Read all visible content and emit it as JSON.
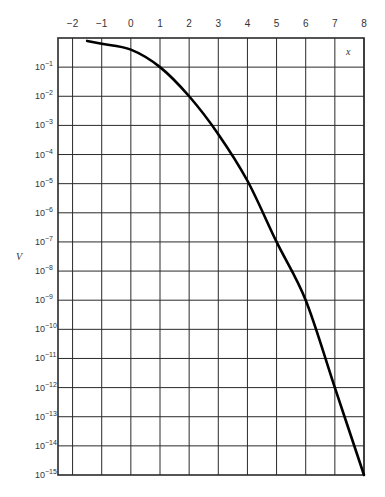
{
  "chart_data": {
    "type": "line",
    "title": "",
    "xlabel": "x",
    "ylabel": "V",
    "x_ticks": [
      "-2",
      "-1",
      "0",
      "1",
      "2",
      "3",
      "4",
      "5",
      "6",
      "7",
      "8"
    ],
    "y_ticks": [
      "10^-1",
      "10^-2",
      "10^-3",
      "10^-4",
      "10^-5",
      "10^-6",
      "10^-7",
      "10^-8",
      "10^-9",
      "10^-10",
      "10^-11",
      "10^-12",
      "10^-13",
      "10^-14",
      "10^-15"
    ],
    "xlim": [
      -2.5,
      8
    ],
    "ylim": [
      1e-15,
      1
    ],
    "yscale": "log",
    "grid": true,
    "legend": null,
    "series": [
      {
        "name": "V",
        "x": [
          -1.5,
          -1,
          0,
          1,
          2,
          3,
          4,
          5,
          6,
          7,
          8
        ],
        "log10_y": [
          -0.1,
          -0.2,
          -0.4,
          -1.0,
          -2.0,
          -3.3,
          -4.9,
          -7.0,
          -9.0,
          -12.0,
          -15.0
        ]
      }
    ]
  },
  "labels": {
    "x_axis_name": "x",
    "y_axis_name": "V"
  },
  "style": {
    "grid_color": "#2a2a2a",
    "curve_color": "#000000"
  }
}
